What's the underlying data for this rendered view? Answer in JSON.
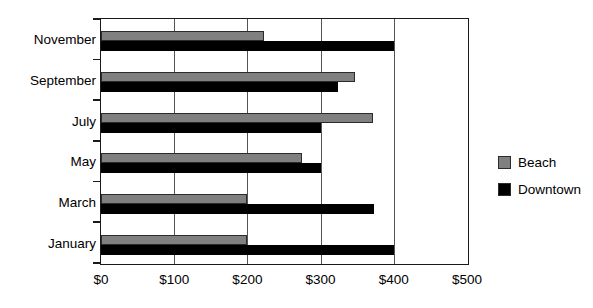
{
  "chart_data": {
    "type": "bar",
    "orientation": "horizontal",
    "title": "",
    "xlabel": "",
    "ylabel": "",
    "categories": [
      "January",
      "March",
      "May",
      "July",
      "September",
      "November"
    ],
    "series": [
      {
        "name": "Beach",
        "color": "#808080",
        "values": [
          200,
          200,
          275,
          372,
          347,
          222
        ]
      },
      {
        "name": "Downtown",
        "color": "#000000",
        "values": [
          400,
          373,
          300,
          300,
          324,
          400
        ]
      }
    ],
    "xlim": [
      0,
      500
    ],
    "xticks": [
      0,
      100,
      200,
      300,
      400,
      500
    ],
    "xtick_labels": [
      "$0",
      "$100",
      "$200",
      "$300",
      "$400",
      "$500"
    ],
    "grid": "vertical",
    "legend_position": "right",
    "legend": [
      {
        "label": "Beach",
        "color": "#808080"
      },
      {
        "label": "Downtown",
        "color": "#000000"
      }
    ]
  },
  "axis": {
    "border_color": "#1a1a1a",
    "grid_color": "#555555"
  }
}
